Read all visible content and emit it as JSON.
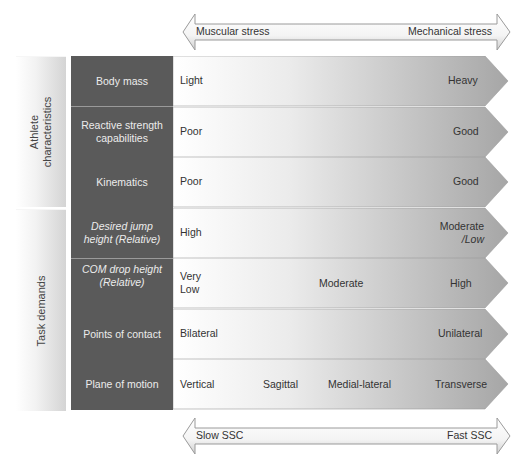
{
  "top_arrow": {
    "left_label": "Muscular stress",
    "right_label": "Mechanical stress"
  },
  "bottom_arrow": {
    "left_label": "Slow SSC",
    "right_label": "Fast SSC"
  },
  "groups": [
    {
      "label_line1": "Athlete",
      "label_line2": "characteristics"
    },
    {
      "label_line1": "Task demands",
      "label_line2": ""
    }
  ],
  "rows": [
    {
      "label": "Body mass",
      "label_italic": "",
      "values": {
        "left": "Light",
        "right": "Heavy"
      }
    },
    {
      "label": "Reactive strength capabilities",
      "label_italic": "",
      "values": {
        "left": "Poor",
        "right": "Good"
      }
    },
    {
      "label": "Kinematics",
      "label_italic": "",
      "values": {
        "left": "Poor",
        "right": "Good"
      }
    },
    {
      "label_part1": "Desired jump height (",
      "label_part2": "Relative",
      "label_part3": ")",
      "values": {
        "left": "High",
        "right_line1": "Moderate",
        "right_line2": "/Low"
      }
    },
    {
      "label_part1": "COM drop height (",
      "label_part2": "Relative",
      "label_part3": ")",
      "values": {
        "left_line1": "Very",
        "left_line2": "Low",
        "mid": "Moderate",
        "right": "High"
      }
    },
    {
      "label": "Points of contact",
      "values": {
        "left": "Bilateral",
        "right": "Unilateral"
      }
    },
    {
      "label": "Plane of motion",
      "values": {
        "v1": "Vertical",
        "v2": "Sagittal",
        "v3": "Medial-lateral",
        "v4": "Transverse"
      }
    }
  ],
  "colors": {
    "dark_column": "#5a5a5a",
    "gradient_start": "#ffffff",
    "gradient_end": "#a8a8a8",
    "divider": "#9a9a9a"
  }
}
